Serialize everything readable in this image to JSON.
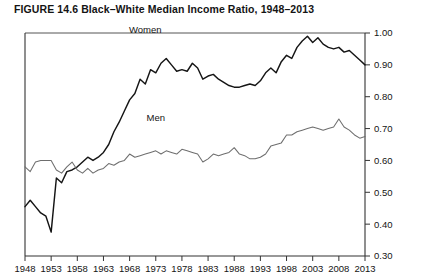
{
  "figure": {
    "label": "FIGURE 14.6",
    "title": "Black–White Median Income Ratio, 1948–2013",
    "full_title": "FIGURE 14.6  Black–White Median Income Ratio, 1948–2013"
  },
  "chart_data": {
    "type": "line",
    "title": "Black–White Median Income Ratio, 1948–2013",
    "xlabel": "",
    "ylabel": "",
    "xlim": [
      1948,
      2013
    ],
    "ylim": [
      0.3,
      1.0
    ],
    "grid": false,
    "legend": "inline-labels",
    "y_axis_position": "right",
    "ytick_labels": [
      "1.00",
      "0.90",
      "0.80",
      "0.70",
      "0.60",
      "0.50",
      "0.40",
      "0.30"
    ],
    "yticks": [
      1.0,
      0.9,
      0.8,
      0.7,
      0.6,
      0.5,
      0.4,
      0.3
    ],
    "xtick_labels": [
      "1948",
      "1953",
      "1958",
      "1963",
      "1968",
      "1973",
      "1978",
      "1983",
      "1988",
      "1993",
      "1998",
      "2003",
      "2008",
      "2013"
    ],
    "xticks": [
      1948,
      1953,
      1958,
      1963,
      1968,
      1973,
      1978,
      1983,
      1988,
      1993,
      1998,
      2003,
      2008,
      2013
    ],
    "x": [
      1948,
      1949,
      1950,
      1951,
      1952,
      1953,
      1954,
      1955,
      1956,
      1957,
      1958,
      1959,
      1960,
      1961,
      1962,
      1963,
      1964,
      1965,
      1966,
      1967,
      1968,
      1969,
      1970,
      1971,
      1972,
      1973,
      1974,
      1975,
      1976,
      1977,
      1978,
      1979,
      1980,
      1981,
      1982,
      1983,
      1984,
      1985,
      1986,
      1987,
      1988,
      1989,
      1990,
      1991,
      1992,
      1993,
      1994,
      1995,
      1996,
      1997,
      1998,
      1999,
      2000,
      2001,
      2002,
      2003,
      2004,
      2005,
      2006,
      2007,
      2008,
      2009,
      2010,
      2011,
      2012,
      2013
    ],
    "series": [
      {
        "name": "Women",
        "color": "#151515",
        "label_position": {
          "x": 1971,
          "y": 1.0
        },
        "values": [
          0.455,
          0.475,
          0.455,
          0.435,
          0.425,
          0.375,
          0.545,
          0.53,
          0.565,
          0.57,
          0.58,
          0.595,
          0.61,
          0.6,
          0.61,
          0.625,
          0.65,
          0.69,
          0.72,
          0.755,
          0.79,
          0.81,
          0.855,
          0.84,
          0.885,
          0.875,
          0.905,
          0.92,
          0.9,
          0.88,
          0.885,
          0.88,
          0.905,
          0.89,
          0.855,
          0.865,
          0.87,
          0.855,
          0.845,
          0.835,
          0.83,
          0.83,
          0.835,
          0.84,
          0.835,
          0.85,
          0.875,
          0.89,
          0.875,
          0.91,
          0.93,
          0.92,
          0.955,
          0.975,
          0.99,
          0.97,
          0.985,
          0.965,
          0.955,
          0.95,
          0.955,
          0.94,
          0.945,
          0.93,
          0.915,
          0.9
        ],
        "note": "Sharp dip to about 0.38 in 1953; peak near 1.00 around 2002; decline to about 0.90 by 2013"
      },
      {
        "name": "Men",
        "color": "#6e6e6e",
        "label_position": {
          "x": 1973,
          "y": 0.725
        },
        "values": [
          0.58,
          0.565,
          0.595,
          0.6,
          0.6,
          0.6,
          0.57,
          0.56,
          0.58,
          0.595,
          0.57,
          0.56,
          0.575,
          0.56,
          0.57,
          0.575,
          0.59,
          0.585,
          0.595,
          0.6,
          0.62,
          0.61,
          0.615,
          0.62,
          0.625,
          0.63,
          0.62,
          0.63,
          0.625,
          0.62,
          0.635,
          0.63,
          0.625,
          0.62,
          0.595,
          0.605,
          0.62,
          0.615,
          0.62,
          0.625,
          0.64,
          0.62,
          0.615,
          0.605,
          0.605,
          0.61,
          0.62,
          0.645,
          0.65,
          0.655,
          0.68,
          0.68,
          0.69,
          0.695,
          0.7,
          0.705,
          0.7,
          0.695,
          0.7,
          0.705,
          0.73,
          0.705,
          0.695,
          0.68,
          0.67,
          0.675
        ],
        "note": "Relatively flat near 0.60 through the 1950s-1980s, rising to about 0.73 in 2008, ending near 0.67"
      }
    ]
  }
}
